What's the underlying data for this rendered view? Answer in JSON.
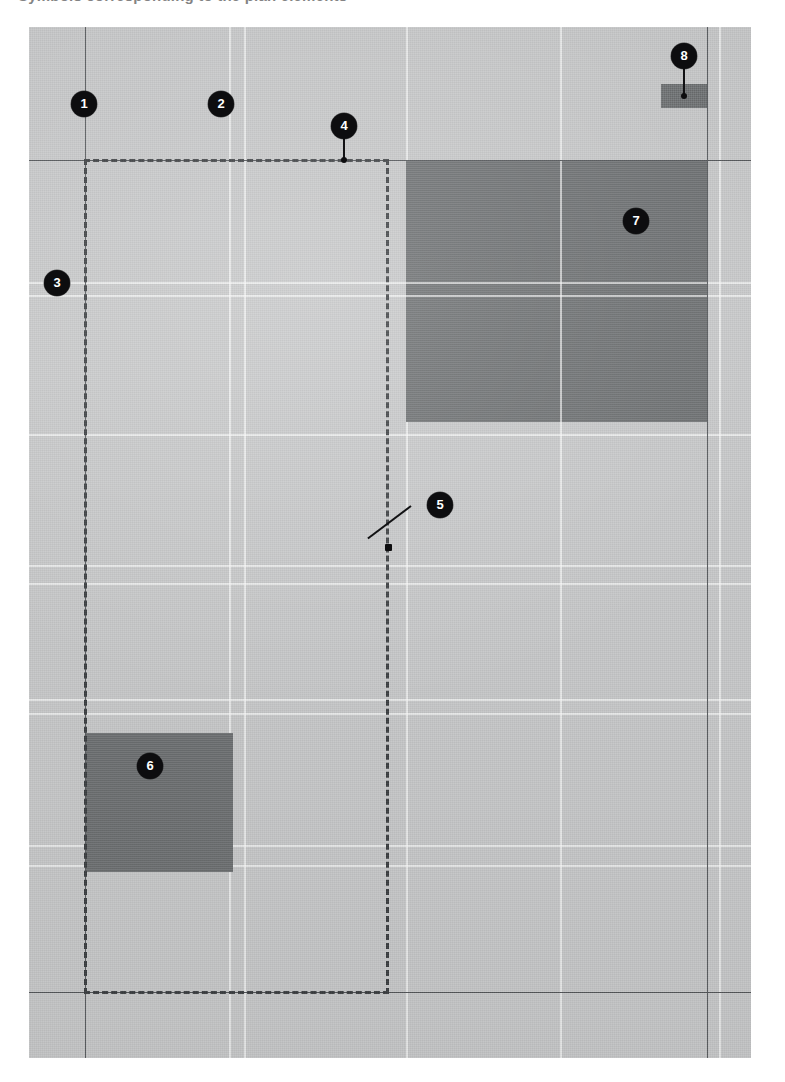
{
  "document": {
    "header_text": "Symbols corresponding to the plan elements",
    "title": "Annotated floor plan with numbered callouts"
  },
  "canvas": {
    "background_color": "#c9cacb",
    "block_color": "#6f7274",
    "line_color_dark": "#55585b",
    "line_color_light": "#ffffff",
    "marker_color": "#0d0d0f",
    "marker_text_color": "#ffffff",
    "dashed_line_color": "#3c3f42"
  },
  "callouts": [
    {
      "id": "1",
      "label": "1",
      "target": "vertical-wall-line-left"
    },
    {
      "id": "2",
      "label": "2",
      "target": "grid-line-interior"
    },
    {
      "id": "3",
      "label": "3",
      "target": "left-boundary-edge"
    },
    {
      "id": "4",
      "label": "4",
      "target": "dashed-boundary-top"
    },
    {
      "id": "5",
      "label": "5",
      "target": "dashed-boundary-right"
    },
    {
      "id": "6",
      "label": "6",
      "target": "small-filled-block"
    },
    {
      "id": "7",
      "label": "7",
      "target": "large-filled-block"
    },
    {
      "id": "8",
      "label": "8",
      "target": "narrow-filled-block"
    }
  ],
  "regions": [
    {
      "name": "dashed-outline-region",
      "style": "dashed"
    },
    {
      "name": "large-filled-block",
      "style": "solid-fill"
    },
    {
      "name": "small-filled-block",
      "style": "solid-fill"
    },
    {
      "name": "narrow-filled-block",
      "style": "solid-fill"
    }
  ]
}
